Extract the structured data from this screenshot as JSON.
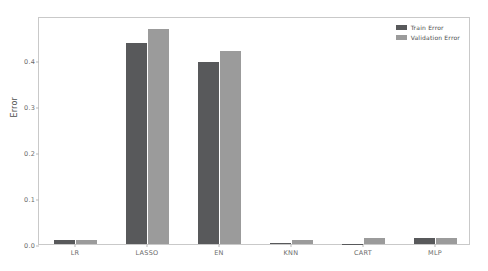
{
  "chart_data": {
    "type": "bar",
    "title": "",
    "xlabel": "",
    "ylabel": "Error",
    "categories": [
      "LR",
      "LASSO",
      "EN",
      "KNN",
      "CART",
      "MLP"
    ],
    "series": [
      {
        "name": "Train Error",
        "color": "#58595b",
        "values": [
          0.009,
          0.437,
          0.396,
          0.003,
          0.0005,
          0.012
        ]
      },
      {
        "name": "Validation Error",
        "color": "#9b9b9b",
        "values": [
          0.009,
          0.467,
          0.42,
          0.008,
          0.013,
          0.013
        ]
      }
    ],
    "ylim": [
      0.0,
      0.495
    ],
    "yticks": [
      0.0,
      0.1,
      0.2,
      0.3,
      0.4
    ],
    "ytick_labels": [
      "0.0",
      "0.1",
      "0.2",
      "0.3",
      "0.4"
    ],
    "grid": false,
    "legend_position": "upper right"
  },
  "legend": {
    "entries": [
      {
        "label": "Train Error",
        "color": "#58595b"
      },
      {
        "label": "Validation Error",
        "color": "#9b9b9b"
      }
    ]
  },
  "axes": {
    "y_label": "Error",
    "frame_color": "#c9c9c9",
    "tick_color": "#6b6b6b"
  }
}
